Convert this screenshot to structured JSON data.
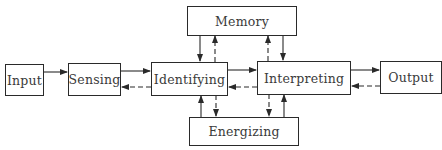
{
  "diagram": {
    "nodes": [
      {
        "id": "input",
        "label": "Input"
      },
      {
        "id": "sensing",
        "label": "Sensing"
      },
      {
        "id": "identifying",
        "label": "Identifying"
      },
      {
        "id": "interpreting",
        "label": "Interpreting"
      },
      {
        "id": "output",
        "label": "Output"
      },
      {
        "id": "memory",
        "label": "Memory"
      },
      {
        "id": "energizing",
        "label": "Energizing"
      }
    ],
    "edges": [
      {
        "from": "input",
        "to": "sensing",
        "style": "solid"
      },
      {
        "from": "sensing",
        "to": "identifying",
        "style": "solid"
      },
      {
        "from": "identifying",
        "to": "sensing",
        "style": "dashed"
      },
      {
        "from": "identifying",
        "to": "interpreting",
        "style": "solid"
      },
      {
        "from": "interpreting",
        "to": "identifying",
        "style": "dashed"
      },
      {
        "from": "interpreting",
        "to": "output",
        "style": "solid"
      },
      {
        "from": "output",
        "to": "interpreting",
        "style": "dashed"
      },
      {
        "from": "memory",
        "to": "identifying",
        "style": "solid"
      },
      {
        "from": "identifying",
        "to": "memory",
        "style": "dashed"
      },
      {
        "from": "interpreting",
        "to": "memory",
        "style": "dashed"
      },
      {
        "from": "memory",
        "to": "interpreting",
        "style": "solid"
      },
      {
        "from": "energizing",
        "to": "identifying",
        "style": "solid"
      },
      {
        "from": "identifying",
        "to": "energizing",
        "style": "dashed"
      },
      {
        "from": "interpreting",
        "to": "energizing",
        "style": "dashed"
      },
      {
        "from": "energizing",
        "to": "interpreting",
        "style": "solid"
      }
    ]
  }
}
